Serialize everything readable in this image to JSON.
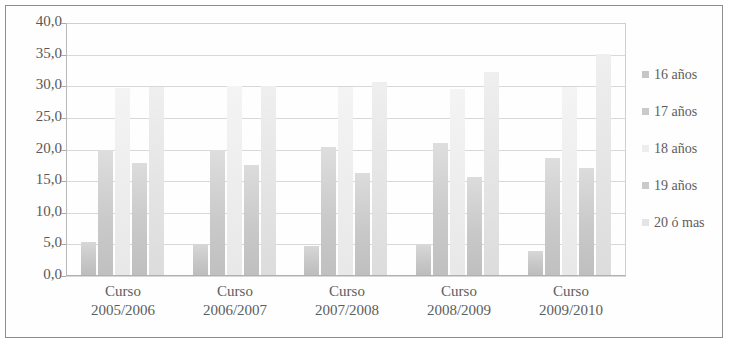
{
  "chart_data": {
    "type": "bar",
    "title": "",
    "subtitle": "",
    "xlabel": "",
    "ylabel": "",
    "categories": [
      "Curso 2005/2006",
      "Curso 2006/2007",
      "Curso 2007/2008",
      "Curso 2008/2009",
      "Curso 2009/2010"
    ],
    "category_lines": [
      [
        "Curso",
        "2005/2006"
      ],
      [
        "Curso",
        "2006/2007"
      ],
      [
        "Curso",
        "2007/2008"
      ],
      [
        "Curso",
        "2008/2009"
      ],
      [
        "Curso",
        "2009/2010"
      ]
    ],
    "series": [
      {
        "name": "16 años",
        "color": "#c6c6c6",
        "values": [
          5.2,
          4.9,
          4.6,
          4.8,
          3.9
        ]
      },
      {
        "name": "17 años",
        "color": "#cacaca",
        "values": [
          20.0,
          19.9,
          20.4,
          21.0,
          18.6
        ]
      },
      {
        "name": "18 años",
        "color": "#ededed",
        "values": [
          29.8,
          30.2,
          30.0,
          29.6,
          29.9
        ]
      },
      {
        "name": "19 años",
        "color": "#c9c9c9",
        "values": [
          17.9,
          17.6,
          16.3,
          15.6,
          17.1
        ]
      },
      {
        "name": "20 ó mas",
        "color": "#e4e4e4",
        "values": [
          29.9,
          30.1,
          30.8,
          32.3,
          35.2
        ]
      }
    ],
    "ylim": [
      0.0,
      40.0
    ],
    "ytick_step": 5.0,
    "yticks": [
      0.0,
      5.0,
      10.0,
      15.0,
      20.0,
      25.0,
      30.0,
      35.0,
      40.0
    ],
    "ytick_labels": [
      "0,0",
      "5,0",
      "10,0",
      "15,0",
      "20,0",
      "25,0",
      "30,0",
      "35,0",
      "40,0"
    ],
    "grid": true,
    "legend_position": "right",
    "legend": [
      "16 años",
      "17 años",
      "18 años",
      "19 años",
      "20 ó mas"
    ]
  }
}
